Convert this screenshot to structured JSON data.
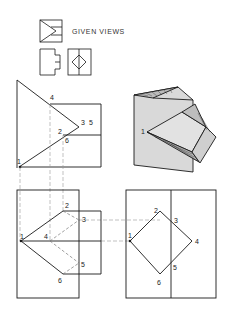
{
  "header": {
    "title": "GIVEN VIEWS"
  },
  "labels": {
    "front_view": {
      "p1": "1",
      "p2": "2",
      "p3": "3",
      "p4": "4",
      "p5": "5",
      "p6": "6"
    },
    "top_view": {
      "p1": "1",
      "p2": "2",
      "p3": "3",
      "p4": "4",
      "p5": "5",
      "p6": "6"
    },
    "side_view": {
      "p1": "1",
      "p2": "2",
      "p3": "3",
      "p4": "4",
      "p5": "5",
      "p6": "6"
    },
    "pictorial": {
      "p1": "1"
    }
  },
  "colors": {
    "line": "#1a1a1a",
    "hidden": "#888888",
    "shade": "#d9d9d9"
  }
}
